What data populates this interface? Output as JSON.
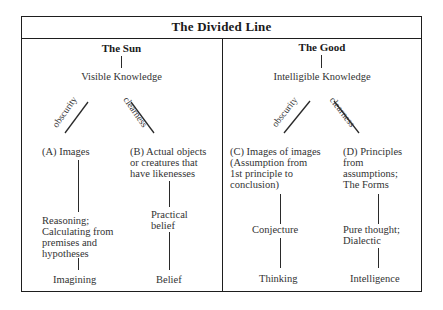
{
  "title": "The Divided Line",
  "left": {
    "heading": "The Sun",
    "knowledge": "Visible Knowledge",
    "branch_left_label": "obscurity",
    "branch_right_label": "clearness",
    "a": {
      "label": "(A) Images",
      "middle": "Reasoning;\nCalculating from\npremises and\nhypotheses",
      "bottom": "Imagining"
    },
    "b": {
      "label": "(B) Actual objects\nor creatures that\nhave likenesses",
      "middle": "Practical\nbelief",
      "bottom": "Belief"
    }
  },
  "right": {
    "heading": "The Good",
    "knowledge": "Intelligible Knowledge",
    "branch_left_label": "obscurity",
    "branch_right_label": "clearness",
    "c": {
      "label": "(C) Images of images\n(Assumption from\n1st principle to\nconclusion)",
      "middle": "Conjecture",
      "bottom": "Thinking"
    },
    "d": {
      "label": "(D) Principles\nfrom\nassumptions;\nThe Forms",
      "middle": "Pure thought;\nDialectic",
      "bottom": "Intelligence"
    }
  }
}
